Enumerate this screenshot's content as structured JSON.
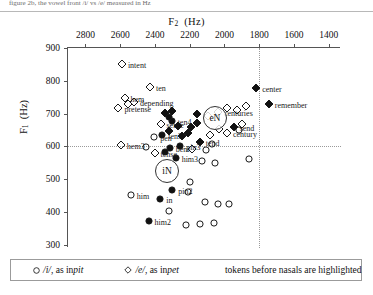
{
  "top_caption": "figure 2b, the vowel front /i/ vs /e/ measured in Hz",
  "chart_data": {
    "type": "scatter",
    "title": "",
    "xlabel": "F2 (Hz)",
    "ylabel": "F1 (Hz)",
    "xlim": [
      2900,
      1330
    ],
    "ylim": [
      900,
      290
    ],
    "x_axis_position": "top",
    "y_axis_direction": "inverted",
    "xticks": [
      2800,
      2600,
      2400,
      2200,
      2000,
      1800,
      1600,
      1400
    ],
    "yticks": [
      300,
      400,
      500,
      600,
      700,
      800,
      900
    ],
    "grid": "two reference dotted lines",
    "reference_lines": {
      "horizontal_f1": 600,
      "vertical_f2": 1800
    },
    "legend": {
      "position": "below-plot",
      "entries": [
        {
          "marker": "circle",
          "symbol": "/i/",
          "text": ", as in ",
          "word": "pit"
        },
        {
          "marker": "diamond",
          "symbol": "/e/",
          "text": ", as in ",
          "word": "pet"
        }
      ],
      "note": "tokens before nasals are highlighted"
    },
    "annotations": [
      {
        "label": "iN",
        "f2": 2330,
        "f1": 524
      },
      {
        "label": "eN",
        "f2": 2055,
        "f1": 688
      }
    ],
    "series": [
      {
        "name": "/i/, as in pit",
        "marker": "circle",
        "points": [
          {
            "f2": 2437,
            "f1": 372,
            "label": "him2",
            "highlighted": true
          },
          {
            "f2": 2321,
            "f1": 404,
            "highlighted": false
          },
          {
            "f2": 2220,
            "f1": 360,
            "highlighted": false
          },
          {
            "f2": 2139,
            "f1": 364,
            "highlighted": false
          },
          {
            "f2": 2061,
            "f1": 366,
            "highlighted": false
          },
          {
            "f2": 2370,
            "f1": 438,
            "label": "in",
            "highlighted": true
          },
          {
            "f2": 2115,
            "f1": 430,
            "highlighted": false
          },
          {
            "f2": 2039,
            "f1": 424,
            "highlighted": false
          },
          {
            "f2": 1975,
            "f1": 424,
            "highlighted": false
          },
          {
            "f2": 2539,
            "f1": 452,
            "label": "him",
            "highlighted": false
          },
          {
            "f2": 2300,
            "f1": 466,
            "label": "pin2",
            "highlighted": true
          },
          {
            "f2": 2210,
            "f1": 460,
            "highlighted": false
          },
          {
            "f2": 2198,
            "f1": 492,
            "highlighted": false
          },
          {
            "f2": 2281,
            "f1": 566,
            "label": "him3",
            "highlighted": true
          },
          {
            "f2": 2340,
            "f1": 582,
            "highlighted": true
          },
          {
            "f2": 2315,
            "f1": 596,
            "label": "bent",
            "highlighted": true
          },
          {
            "f2": 2254,
            "f1": 600,
            "label": "pin3",
            "highlighted": true
          },
          {
            "f2": 2454,
            "f1": 598,
            "highlighted": false
          },
          {
            "f2": 2404,
            "f1": 630,
            "label": "pen",
            "highlighted": false
          },
          {
            "f2": 2358,
            "f1": 634,
            "label": "ten3",
            "highlighted": true
          },
          {
            "f2": 2109,
            "f1": 588,
            "highlighted": false
          },
          {
            "f2": 2073,
            "f1": 606,
            "highlighted": false
          },
          {
            "f2": 2128,
            "f1": 556,
            "highlighted": false
          },
          {
            "f2": 2054,
            "f1": 548,
            "highlighted": false
          },
          {
            "f2": 1860,
            "f1": 560,
            "highlighted": false
          },
          {
            "f2": 1915,
            "f1": 650,
            "highlighted": false
          },
          {
            "f2": 2304,
            "f1": 676,
            "label": "ten4",
            "highlighted": true
          },
          {
            "f2": 2322,
            "f1": 690,
            "highlighted": true
          }
        ]
      },
      {
        "name": "/e/, as in pet",
        "marker": "diamond",
        "points": [
          {
            "f2": 2402,
            "f1": 580,
            "label": "tense",
            "highlighted": false
          },
          {
            "f2": 2596,
            "f1": 604,
            "label": "hem3",
            "highlighted": false
          },
          {
            "f2": 2188,
            "f1": 592,
            "highlighted": false
          },
          {
            "f2": 2143,
            "f1": 614,
            "label": "tend",
            "highlighted": true
          },
          {
            "f2": 2245,
            "f1": 632,
            "highlighted": true
          },
          {
            "f2": 2209,
            "f1": 642,
            "highlighted": true
          },
          {
            "f2": 2320,
            "f1": 648,
            "highlighted": true
          },
          {
            "f2": 2368,
            "f1": 668,
            "label": "sense",
            "highlighted": false
          },
          {
            "f2": 2267,
            "f1": 662,
            "highlighted": true
          },
          {
            "f2": 2190,
            "f1": 660,
            "highlighted": true
          },
          {
            "f2": 2160,
            "f1": 672,
            "highlighted": true
          },
          {
            "f2": 2086,
            "f1": 636,
            "highlighted": false
          },
          {
            "f2": 2034,
            "f1": 652,
            "highlighted": false
          },
          {
            "f2": 1986,
            "f1": 640,
            "label": "century",
            "highlighted": false
          },
          {
            "f2": 1947,
            "f1": 658,
            "label": "send",
            "highlighted": true
          },
          {
            "f2": 1899,
            "f1": 668,
            "highlighted": false
          },
          {
            "f2": 2340,
            "f1": 702,
            "highlighted": true
          },
          {
            "f2": 2302,
            "f1": 708,
            "highlighted": true
          },
          {
            "f2": 2160,
            "f1": 700,
            "highlighted": true
          },
          {
            "f2": 2097,
            "f1": 694,
            "highlighted": false
          },
          {
            "f2": 2038,
            "f1": 706,
            "label": "centuries",
            "highlighted": false
          },
          {
            "f2": 1985,
            "f1": 716,
            "highlighted": false
          },
          {
            "f2": 1930,
            "f1": 712,
            "highlighted": false
          },
          {
            "f2": 1878,
            "f1": 722,
            "highlighted": false
          },
          {
            "f2": 2610,
            "f1": 716,
            "label": "pretense",
            "highlighted": false
          },
          {
            "f2": 2556,
            "f1": 728,
            "highlighted": false
          },
          {
            "f2": 2520,
            "f1": 734,
            "label": "depending",
            "highlighted": false
          },
          {
            "f2": 2575,
            "f1": 748,
            "label": "hem",
            "highlighted": false
          },
          {
            "f2": 2428,
            "f1": 782,
            "label": "ten",
            "highlighted": false
          },
          {
            "f2": 2590,
            "f1": 852,
            "label": "intent",
            "highlighted": false
          },
          {
            "f2": 1745,
            "f1": 728,
            "label": "remember",
            "highlighted": true
          },
          {
            "f2": 1818,
            "f1": 778,
            "label": "center",
            "highlighted": true
          }
        ]
      }
    ]
  }
}
